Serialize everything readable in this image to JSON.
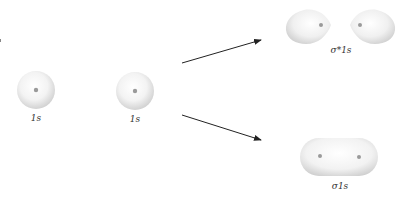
{
  "diagram": {
    "atomic_orbitals": [
      {
        "id": "ao-left",
        "label": "1s",
        "cx": 36,
        "cy": 90,
        "r": 19
      },
      {
        "id": "ao-right",
        "label": "1s",
        "cx": 135,
        "cy": 91,
        "r": 19
      }
    ],
    "molecular_orbitals": [
      {
        "id": "antibonding",
        "label": "σ*1s",
        "type": "antibonding",
        "nuclei": [
          [
            321,
            25
          ],
          [
            360,
            25
          ]
        ]
      },
      {
        "id": "bonding",
        "label": "σ1s",
        "type": "bonding",
        "nuclei": [
          [
            320,
            156
          ],
          [
            359,
            157
          ]
        ]
      }
    ],
    "arrows": [
      {
        "from": [
          182,
          63
        ],
        "to": [
          262,
          40
        ],
        "target": "antibonding"
      },
      {
        "from": [
          182,
          115
        ],
        "to": [
          262,
          140
        ],
        "target": "bonding"
      }
    ],
    "colors": {
      "orbital_fill_light": "#ffffff",
      "orbital_fill_dark": "#d4d4d4",
      "nucleus": "#9a9a9a",
      "arrow": "#222222"
    }
  }
}
